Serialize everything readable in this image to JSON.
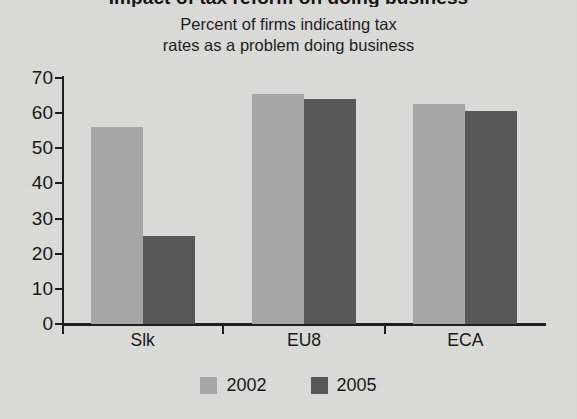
{
  "title": {
    "main": "Impact of tax reform on doing business",
    "subtitle_line1": "Percent of firms indicating tax",
    "subtitle_line2": "rates as a problem doing business"
  },
  "axes": {
    "y_ticks": [
      "0",
      "10",
      "20",
      "30",
      "40",
      "50",
      "60",
      "70"
    ],
    "x_categories": [
      "Slk",
      "EU8",
      "ECA"
    ]
  },
  "legend": {
    "items": [
      {
        "label": "2002",
        "color": "#a8a8a8"
      },
      {
        "label": "2005",
        "color": "#565656"
      }
    ]
  },
  "chart_data": {
    "type": "bar",
    "title": "Impact of tax reform on doing business",
    "subtitle": "Percent of firms indicating tax rates as a problem doing business",
    "xlabel": "",
    "ylabel": "",
    "ylim": [
      0,
      70
    ],
    "ytick_step": 10,
    "grid": false,
    "legend_position": "bottom-center",
    "categories": [
      "Slk",
      "EU8",
      "ECA"
    ],
    "series": [
      {
        "name": "2002",
        "color": "#a8a8a8",
        "values": [
          56,
          65.5,
          62.5
        ]
      },
      {
        "name": "2005",
        "color": "#565656",
        "values": [
          25,
          64,
          60.5
        ]
      }
    ]
  }
}
